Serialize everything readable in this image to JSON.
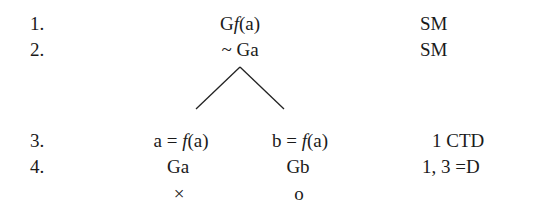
{
  "tree": {
    "lines": [
      {
        "number": "1.",
        "formula_pre": "G",
        "formula_func": "f",
        "formula_post": "(a)",
        "justification": "SM"
      },
      {
        "number": "2.",
        "formula": "~ Ga",
        "justification": "SM"
      },
      {
        "number": "3.",
        "left_branch": {
          "pre": "a = ",
          "func": "f",
          "post": "(a)"
        },
        "right_branch": {
          "pre": "b = ",
          "func": "f",
          "post": "(a)"
        },
        "justification": "1 CTD"
      },
      {
        "number": "4.",
        "left_branch": "Ga",
        "right_branch": "Gb",
        "justification": "1, 3 =D"
      }
    ],
    "branch_markers": {
      "left": "×",
      "right": "o"
    }
  }
}
